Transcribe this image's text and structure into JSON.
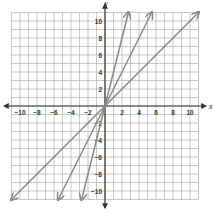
{
  "chart_data": {
    "type": "line",
    "title": "",
    "xlabel": "x",
    "ylabel": "y",
    "xlim": [
      -11,
      11
    ],
    "ylim": [
      -11,
      11
    ],
    "grid": true,
    "x_ticks": [
      -10,
      -8,
      -6,
      -4,
      -2,
      2,
      4,
      6,
      8,
      10
    ],
    "y_ticks": [
      -10,
      -8,
      -6,
      -4,
      -2,
      2,
      4,
      6,
      8,
      10
    ],
    "series": [
      {
        "name": "y = x",
        "slope": 1,
        "points": [
          [
            -11,
            -11
          ],
          [
            11,
            11
          ]
        ]
      },
      {
        "name": "y = 2x",
        "slope": 2,
        "points": [
          [
            -5.5,
            -11
          ],
          [
            5.5,
            11
          ]
        ]
      },
      {
        "name": "y = 4x",
        "slope": 4,
        "points": [
          [
            -2.75,
            -11
          ],
          [
            2.75,
            11
          ]
        ]
      }
    ],
    "line_color": "#8a8a8a",
    "grid_color": "#b0b0b0"
  }
}
